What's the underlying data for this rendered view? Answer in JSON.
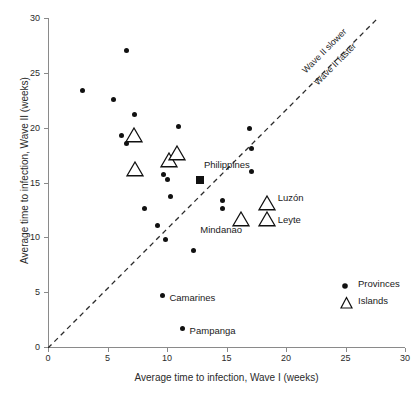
{
  "chart_data": {
    "type": "scatter",
    "title": "",
    "xlabel": "Average time to infection, Wave I (weeks)",
    "ylabel": "Average time to infection, Wave II (weeks)",
    "xlim": [
      0,
      30
    ],
    "ylim": [
      0,
      30
    ],
    "xticks": [
      0,
      5,
      10,
      15,
      20,
      25,
      30
    ],
    "yticks": [
      0,
      5,
      10,
      15,
      20,
      25,
      30
    ],
    "grid": false,
    "legend_position": "bottom-right",
    "reference_line": {
      "type": "identity",
      "style": "dashed",
      "label_above": "Wave II slower",
      "label_below": "Wave II faster"
    },
    "series": [
      {
        "name": "Provinces",
        "marker": "filled-circle",
        "color": "#111111",
        "points": [
          {
            "x": 6.6,
            "y": 27.0
          },
          {
            "x": 2.9,
            "y": 23.4
          },
          {
            "x": 5.5,
            "y": 22.6
          },
          {
            "x": 7.25,
            "y": 21.2
          },
          {
            "x": 11.0,
            "y": 20.1
          },
          {
            "x": 16.9,
            "y": 19.9
          },
          {
            "x": 6.2,
            "y": 19.3
          },
          {
            "x": 6.6,
            "y": 18.6
          },
          {
            "x": 17.1,
            "y": 18.1
          },
          {
            "x": 10.9,
            "y": 17.6
          },
          {
            "x": 10.4,
            "y": 17.0
          },
          {
            "x": 17.1,
            "y": 16.0
          },
          {
            "x": 9.7,
            "y": 15.7
          },
          {
            "x": 10.0,
            "y": 15.3
          },
          {
            "x": 12.8,
            "y": 15.2
          },
          {
            "x": 10.3,
            "y": 13.7
          },
          {
            "x": 14.7,
            "y": 13.4
          },
          {
            "x": 14.7,
            "y": 12.6
          },
          {
            "x": 8.1,
            "y": 12.6
          },
          {
            "x": 9.2,
            "y": 11.1
          },
          {
            "x": 9.9,
            "y": 9.8
          },
          {
            "x": 12.2,
            "y": 8.8
          },
          {
            "x": 9.6,
            "y": 4.7
          },
          {
            "x": 11.3,
            "y": 1.7
          }
        ]
      },
      {
        "name": "Islands",
        "marker": "open-triangle",
        "color": "#111111",
        "points": [
          {
            "x": 7.2,
            "y": 19.3
          },
          {
            "x": 10.2,
            "y": 17.1
          },
          {
            "x": 10.8,
            "y": 17.7
          },
          {
            "x": 7.3,
            "y": 16.2
          },
          {
            "x": 18.4,
            "y": 13.1
          },
          {
            "x": 18.4,
            "y": 11.7
          },
          {
            "x": 16.2,
            "y": 11.7
          }
        ]
      },
      {
        "name": "Philippines",
        "marker": "filled-square",
        "color": "#111111",
        "points": [
          {
            "x": 12.8,
            "y": 15.2
          }
        ]
      }
    ],
    "annotations": [
      {
        "text": "Philippines",
        "x": 13.1,
        "y": 16.6
      },
      {
        "text": "Luzón",
        "x": 19.3,
        "y": 13.6
      },
      {
        "text": "Leyte",
        "x": 19.3,
        "y": 11.6
      },
      {
        "text": "Mindanao",
        "x": 12.8,
        "y": 10.7
      },
      {
        "text": "Camarines",
        "x": 10.2,
        "y": 4.5
      },
      {
        "text": "Pampanga",
        "x": 11.9,
        "y": 1.5
      }
    ]
  },
  "axes": {
    "x_title": "Average time to infection, Wave I (weeks)",
    "y_title": "Average time to infection, Wave II (weeks)",
    "x_tick_labels": [
      "0",
      "5",
      "10",
      "15",
      "20",
      "25",
      "30"
    ],
    "y_tick_labels": [
      "0",
      "5",
      "10",
      "15",
      "20",
      "25",
      "30"
    ]
  },
  "reference_labels": {
    "slower": "Wave II slower",
    "faster": "Wave II faster"
  },
  "legend": {
    "entries": [
      {
        "label": "Provinces",
        "symbol": "filled-circle"
      },
      {
        "label": "Islands",
        "symbol": "open-triangle"
      }
    ]
  },
  "colors": {
    "marker": "#111111",
    "axis": "#8a8a8a",
    "text": "#1a1a1a"
  }
}
